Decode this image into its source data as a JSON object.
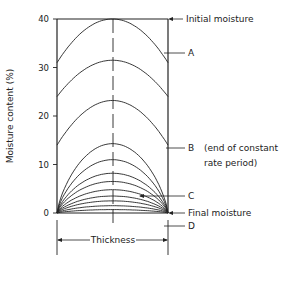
{
  "diagram": {
    "type": "moisture-profile-drying",
    "y_axis": {
      "label": "Moisture content (%)",
      "ticks": [
        "40",
        "30",
        "20",
        "10",
        "0"
      ],
      "tick_values": [
        40,
        30,
        20,
        10,
        0
      ],
      "range": [
        0,
        40
      ]
    },
    "x_axis": {
      "label": "Thickness"
    },
    "annotations": {
      "initial": "Initial moisture",
      "a": "A",
      "b": "B",
      "b_note_line1": "(end of constant",
      "b_note_line2": "rate period)",
      "c": "C",
      "d": "D",
      "final": "Final moisture"
    },
    "initial_level": 40,
    "profiles": [
      {
        "center": 40,
        "edge": 31
      },
      {
        "center": 31.5,
        "edge": 24
      },
      {
        "center": 23.2,
        "edge": 14
      },
      {
        "center": 14.3,
        "edge": 0
      },
      {
        "center": 11,
        "edge": 0
      },
      {
        "center": 8.2,
        "edge": 0
      },
      {
        "center": 6.5,
        "edge": 0
      },
      {
        "center": 4.8,
        "edge": 0
      },
      {
        "center": 3.5,
        "edge": 0
      },
      {
        "center": 2.5,
        "edge": 0
      },
      {
        "center": 1.5,
        "edge": 0
      },
      {
        "center": 0.7,
        "edge": 0
      }
    ],
    "colors": {
      "ink": "#222222",
      "background": "#ffffff"
    }
  }
}
